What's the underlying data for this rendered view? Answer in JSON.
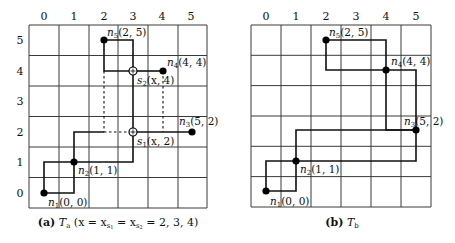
{
  "figures": [
    {
      "id": "a",
      "caption_prefix": "(a)",
      "caption_symbol": "T",
      "caption_subscript": "a",
      "caption_rest": "(x = x",
      "caption_s1": "s",
      "caption_s1_sub": "1",
      "caption_eq": " = x",
      "caption_s2": "s",
      "caption_s2_sub": "2",
      "caption_tail": " = 2, 3, 4)",
      "x_labels": [
        "0",
        "1",
        "2",
        "3",
        "4",
        "5"
      ],
      "y_labels": [
        "0",
        "1",
        "2",
        "3",
        "4",
        "5"
      ],
      "nodes": [
        {
          "name": "n",
          "sub": "1",
          "coords": "(0, 0)",
          "x": 0,
          "y": 0,
          "type": "filled"
        },
        {
          "name": "n",
          "sub": "2",
          "coords": "(1, 1)",
          "x": 1,
          "y": 1,
          "type": "filled"
        },
        {
          "name": "n",
          "sub": "3",
          "coords": "(5, 2)",
          "x": 5,
          "y": 2,
          "type": "filled"
        },
        {
          "name": "n",
          "sub": "4",
          "coords": "(4, 4)",
          "x": 4,
          "y": 4,
          "type": "filled"
        },
        {
          "name": "n",
          "sub": "5",
          "coords": "(2, 5)",
          "x": 2,
          "y": 5,
          "type": "filled"
        },
        {
          "name": "s",
          "sub": "1",
          "coords": "(x, 2)",
          "x": 3,
          "y": 2,
          "type": "steiner"
        },
        {
          "name": "s",
          "sub": "2",
          "coords": "(x, 4)",
          "x": 3,
          "y": 4,
          "type": "steiner"
        }
      ]
    },
    {
      "id": "b",
      "caption_prefix": "(b)",
      "caption_symbol": "T",
      "caption_subscript": "b",
      "x_labels": [
        "0",
        "1",
        "2",
        "3",
        "4",
        "5"
      ],
      "nodes": [
        {
          "name": "n",
          "sub": "1",
          "coords": "(0, 0)",
          "x": 0,
          "y": 0,
          "type": "filled"
        },
        {
          "name": "n",
          "sub": "2",
          "coords": "(1, 1)",
          "x": 1,
          "y": 1,
          "type": "filled"
        },
        {
          "name": "n",
          "sub": "3",
          "coords": "(5, 2)",
          "x": 5,
          "y": 2,
          "type": "filled"
        },
        {
          "name": "n",
          "sub": "4",
          "coords": "(4, 4)",
          "x": 4,
          "y": 4,
          "type": "filled"
        },
        {
          "name": "n",
          "sub": "5",
          "coords": "(2, 5)",
          "x": 2,
          "y": 5,
          "type": "filled"
        }
      ]
    }
  ]
}
